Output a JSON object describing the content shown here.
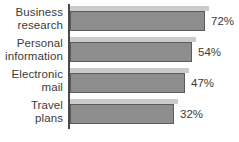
{
  "chart_data": {
    "type": "bar",
    "orientation": "horizontal",
    "title": "",
    "subtitle": "",
    "xlabel": "",
    "ylabel": "",
    "categories": [
      "Business research",
      "Personal information",
      "Electronic mail",
      "Travel plans"
    ],
    "values": [
      72,
      54,
      47,
      32
    ],
    "value_labels": [
      "72%",
      "54%",
      "47%",
      "32%"
    ],
    "unit": "%",
    "grid": false,
    "legend": null,
    "axis": {
      "category_axis_visible": true,
      "value_axis_visible": false,
      "tick_labels": []
    },
    "colors": {
      "bar_fill": "#8d8d8d",
      "bar_border": "#5c5c5c",
      "bar_highlight": "#cbcbcb",
      "axis": "#4a4a4a",
      "text": "#3b3b3b",
      "background": "#ffffff"
    },
    "bars": [
      {
        "label_line1": "Business",
        "label_line2": "research",
        "value_label": "72%",
        "value": 72,
        "bar_px": 135,
        "highlight_px": 139,
        "top": 6
      },
      {
        "label_line1": "Personal",
        "label_line2": "information",
        "value_label": "54%",
        "value": 54,
        "bar_px": 122,
        "highlight_px": 126,
        "top": 37
      },
      {
        "label_line1": "Electronic",
        "label_line2": "mail",
        "value_label": "47%",
        "value": 47,
        "bar_px": 115,
        "highlight_px": 119,
        "top": 68
      },
      {
        "label_line1": "Travel",
        "label_line2": "plans",
        "value_label": "32%",
        "value": 32,
        "bar_px": 104,
        "highlight_px": 108,
        "top": 99
      }
    ]
  }
}
